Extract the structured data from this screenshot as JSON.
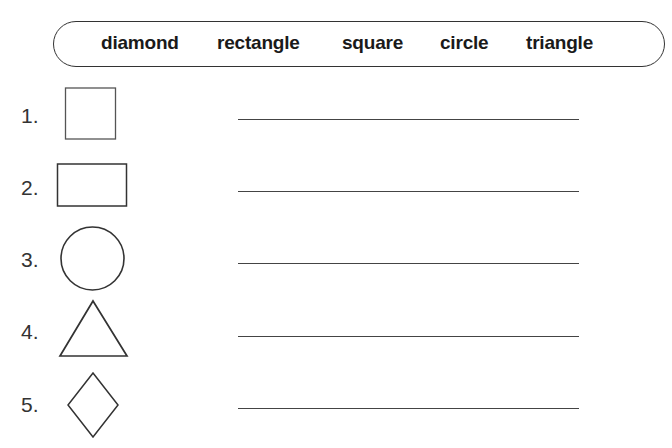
{
  "word_bank": {
    "words": [
      "diamond",
      "rectangle",
      "square",
      "circle",
      "triangle"
    ]
  },
  "questions": [
    {
      "number": "1.",
      "shape": "square-icon"
    },
    {
      "number": "2.",
      "shape": "rectangle-icon"
    },
    {
      "number": "3.",
      "shape": "circle-icon"
    },
    {
      "number": "4.",
      "shape": "triangle-icon"
    },
    {
      "number": "5.",
      "shape": "diamond-icon"
    }
  ],
  "answers": [
    "",
    "",
    "",
    "",
    ""
  ]
}
